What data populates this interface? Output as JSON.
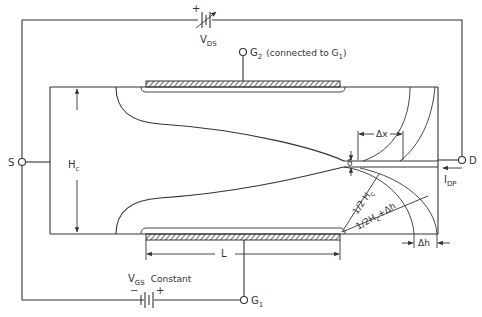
{
  "diagram": {
    "type": "device-cross-section-schematic",
    "labels": {
      "vds": "V",
      "vds_sub": "DS",
      "g2": "G",
      "g2_sub": "2",
      "g2_note": "(connected to G",
      "g2_note_sub": "1",
      "g2_note_end": ")",
      "source": "S",
      "drain": "D",
      "hc": "H",
      "hc_sub": "c",
      "delta_x": "Δx",
      "delta": "δ",
      "idp": "I",
      "idp_sub": "DP",
      "half_hc": "1/2 H",
      "half_hc_sub": "c",
      "half_hc_dh": "1/2H",
      "half_hc_dh_sub": "c",
      "half_hc_dh_end": "+Δh",
      "delta_h": "Δh",
      "length": "L",
      "vgs": "V",
      "vgs_sub": "GS",
      "vgs_note": "Constant",
      "vgs_minus": "−",
      "vgs_plus": "+",
      "vds_plus": "+",
      "g1": "G",
      "g1_sub": "1"
    },
    "colors": {
      "line": "#333333",
      "background": "#ffffff"
    }
  }
}
